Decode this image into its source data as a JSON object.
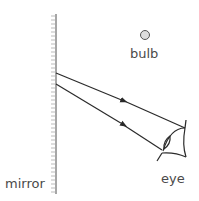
{
  "diagram": {
    "labels": {
      "bulb": "bulb",
      "eye": "eye",
      "mirror": "mirror"
    },
    "colors": {
      "line": "#2a2a2a",
      "mirror": "#888888",
      "bulb_fill": "#dddddd",
      "text": "#4a4a4a"
    }
  }
}
